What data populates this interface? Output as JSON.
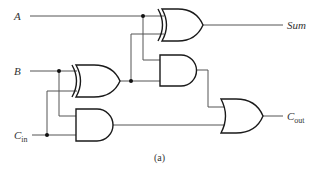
{
  "diagram": {
    "caption": "(a)",
    "inputs": [
      {
        "id": "A",
        "label": "A"
      },
      {
        "id": "B",
        "label": "B"
      },
      {
        "id": "Cin",
        "label": "C",
        "subscript": "in"
      }
    ],
    "outputs": [
      {
        "id": "Sum",
        "label": "Sum"
      },
      {
        "id": "Cout",
        "label": "C",
        "subscript": "out"
      }
    ],
    "gates": [
      {
        "id": "xor-top",
        "type": "XOR",
        "inputs": [
          "A",
          "xor-bottom"
        ],
        "output": "Sum"
      },
      {
        "id": "xor-bottom",
        "type": "XOR",
        "inputs": [
          "B",
          "Cin"
        ],
        "output": "xor-top, and-top"
      },
      {
        "id": "and-top",
        "type": "AND",
        "inputs": [
          "A",
          "xor-bottom"
        ],
        "output": "or-out"
      },
      {
        "id": "and-bottom",
        "type": "AND",
        "inputs": [
          "B",
          "Cin"
        ],
        "output": "or-out"
      },
      {
        "id": "or-out",
        "type": "OR",
        "inputs": [
          "and-top",
          "and-bottom"
        ],
        "output": "Cout"
      }
    ],
    "colors": {
      "wire": "#555555",
      "gate": "#1a1a1a",
      "text": "#333333"
    }
  }
}
